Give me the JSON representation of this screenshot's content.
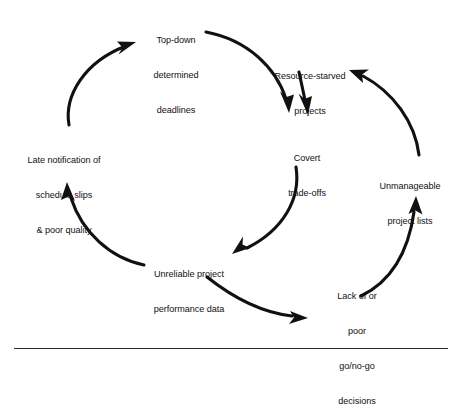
{
  "diagram": {
    "type": "causal-loop",
    "stroke_color": "#111111",
    "background_color": "#ffffff",
    "nodes": [
      {
        "id": "top-down-deadlines",
        "lines": [
          "Top-down",
          "determined",
          "deadlines"
        ],
        "position": "top"
      },
      {
        "id": "resource-starved-projects",
        "lines": [
          "Resource-starved",
          "projects"
        ],
        "position": "top-right"
      },
      {
        "id": "covert-trade-offs",
        "lines": [
          "Covert",
          "trade-offs"
        ],
        "position": "center"
      },
      {
        "id": "unmanageable-project-lists",
        "lines": [
          "Unmanageable",
          "project lists"
        ],
        "position": "right"
      },
      {
        "id": "lack-of-go-no-go-decisions",
        "lines": [
          "Lack of or",
          "poor",
          "go/no-go",
          "decisions"
        ],
        "position": "bottom-right"
      },
      {
        "id": "unreliable-project-performance-data",
        "lines": [
          "Unreliable project",
          "performance data"
        ],
        "position": "bottom"
      },
      {
        "id": "late-notification",
        "lines": [
          "Late notification of",
          "schedule slips",
          "& poor quality"
        ],
        "position": "left"
      }
    ],
    "edges": [
      {
        "id": "edge-topdown-to-covert",
        "from": "top-down-deadlines",
        "to": "covert-trade-offs"
      },
      {
        "id": "edge-resource-to-covert",
        "from": "resource-starved-projects",
        "to": "covert-trade-offs"
      },
      {
        "id": "edge-covert-to-unreliable",
        "from": "covert-trade-offs",
        "to": "unreliable-project-performance-data"
      },
      {
        "id": "edge-unreliable-to-late",
        "from": "unreliable-project-performance-data",
        "to": "late-notification"
      },
      {
        "id": "edge-late-to-topdown",
        "from": "late-notification",
        "to": "top-down-deadlines"
      },
      {
        "id": "edge-unreliable-to-lack",
        "from": "unreliable-project-performance-data",
        "to": "lack-of-go-no-go-decisions"
      },
      {
        "id": "edge-lack-to-unmanageable",
        "from": "lack-of-go-no-go-decisions",
        "to": "unmanageable-project-lists"
      },
      {
        "id": "edge-unmanageable-to-resource",
        "from": "unmanageable-project-lists",
        "to": "resource-starved-projects"
      }
    ]
  }
}
